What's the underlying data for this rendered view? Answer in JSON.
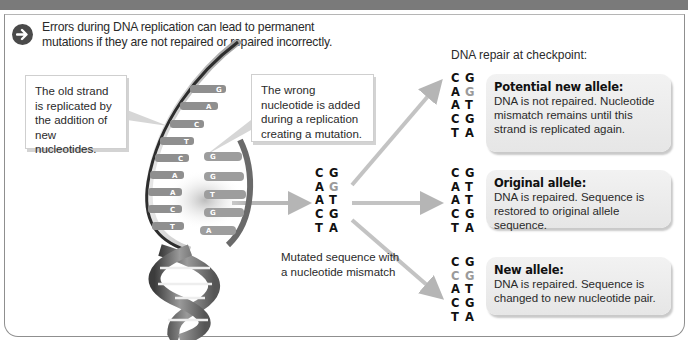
{
  "intro": {
    "icon": "arrow-right-circle-icon",
    "text_line1": "Errors during DNA replication can lead to permanent",
    "text_line2": "mutations if they are not repaired or repaired incorrectly."
  },
  "callouts": {
    "left": "The old strand is replicated by the addition of new nucleotides.",
    "right": "The wrong nucleotide is added during a replication creating a mutation."
  },
  "helix": {
    "old_strand_labels": [
      "G",
      "A",
      "C",
      "T",
      "C",
      "A",
      "A",
      "C",
      "T"
    ],
    "new_strand_labels": [
      "G",
      "G",
      "T",
      "G",
      "A"
    ]
  },
  "mutated": {
    "sequence": [
      {
        "l": "C",
        "r": "G",
        "gray_l": false,
        "gray_r": false
      },
      {
        "l": "A",
        "r": "G",
        "gray_l": false,
        "gray_r": true
      },
      {
        "l": "A",
        "r": "T",
        "gray_l": false,
        "gray_r": false
      },
      {
        "l": "C",
        "r": "G",
        "gray_l": false,
        "gray_r": false
      },
      {
        "l": "T",
        "r": "A",
        "gray_l": false,
        "gray_r": false
      }
    ],
    "caption": "Mutated sequence with a nucleotide mismatch"
  },
  "repair": {
    "title": "DNA repair at checkpoint:",
    "outcomes": [
      {
        "title": "Potential new allele:",
        "text": "DNA is not repaired. Nucleotide mismatch remains until this strand is replicated again.",
        "sequence": [
          [
            "C",
            "G"
          ],
          [
            "A",
            "G*"
          ],
          [
            "A",
            "T"
          ],
          [
            "C",
            "G"
          ],
          [
            "T",
            "A"
          ]
        ]
      },
      {
        "title": "Original allele:",
        "text": "DNA is repaired. Sequence is restored to original allele sequence.",
        "sequence": [
          [
            "C",
            "G"
          ],
          [
            "A",
            "T"
          ],
          [
            "A",
            "T"
          ],
          [
            "C",
            "G"
          ],
          [
            "T",
            "A"
          ]
        ]
      },
      {
        "title": "New allele:",
        "text": "DNA is repaired. Sequence is changed to new nucleotide pair.",
        "sequence": [
          [
            "C",
            "G"
          ],
          [
            "C*",
            "G*"
          ],
          [
            "A",
            "T"
          ],
          [
            "C",
            "G"
          ],
          [
            "T",
            "A"
          ]
        ]
      }
    ]
  },
  "colors": {
    "top_bar": "#7a7a7a",
    "arrow": "#b5b5b5",
    "box_bg": "#ececec",
    "mismatch_gray": "#9a9a9a",
    "text": "#2a2a2a"
  }
}
